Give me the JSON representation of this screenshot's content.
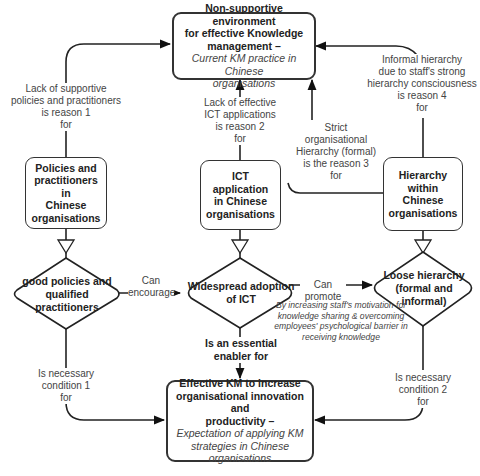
{
  "nodes": {
    "top": {
      "title_lines": [
        "Non-supportive environment",
        "for effective Knowledge",
        "management –"
      ],
      "subtitle_lines": [
        "Current KM practice in Chinese",
        "organisations"
      ]
    },
    "policies": {
      "lines": [
        "Policies and",
        "practitioners in",
        "Chinese",
        "organisations"
      ]
    },
    "ict": {
      "lines": [
        "ICT application",
        "in Chinese",
        "organisations"
      ]
    },
    "hierarchy": {
      "lines": [
        "Hierarchy within",
        "Chinese",
        "organisations"
      ]
    },
    "bottom": {
      "title_lines": [
        "Effective KM to increase",
        "organisational innovation and",
        "productivity –"
      ],
      "subtitle_lines": [
        "Expectation of applying KM",
        "strategies in Chinese",
        "organisations"
      ]
    }
  },
  "decisions": {
    "good_policies": {
      "lines": [
        "good policies and",
        "qualified",
        "practitioners"
      ]
    },
    "widespread_ict": {
      "lines": [
        "Widespread adoption",
        "of ICT"
      ]
    },
    "loose_hierarchy": {
      "lines": [
        "Loose hierarchy",
        "(formal and",
        "informal)"
      ]
    }
  },
  "edges": {
    "reason1": {
      "lines": [
        "Lack of supportive",
        "policies and practitioners",
        "is reason 1",
        "for"
      ]
    },
    "reason2": {
      "lines": [
        "Lack of effective",
        "ICT applications",
        "is reason 2",
        "for"
      ]
    },
    "reason3": {
      "lines": [
        "Strict",
        "organisational",
        "Hierarchy (formal)",
        "is the reason 3",
        "for"
      ]
    },
    "reason4": {
      "lines": [
        "Informal hierarchy",
        "due to staff's strong",
        "hierarchy consciousness",
        "is reason 4",
        "for"
      ]
    },
    "can_encourage": {
      "lines": [
        "Can",
        "encourage"
      ]
    },
    "can_promote": {
      "lines": [
        "Can promote"
      ]
    },
    "promote_note": {
      "lines": [
        "By increasing staff's motivation for",
        "knowledge sharing & overcoming",
        "employees' psychological barrier in",
        "receiving knowledge"
      ]
    },
    "enabler": {
      "lines": [
        "Is an essential",
        "enabler for"
      ]
    },
    "condition1": {
      "lines": [
        "Is necessary",
        "condition 1",
        "for"
      ]
    },
    "condition2": {
      "lines": [
        "Is necessary",
        "condition 2",
        "for"
      ]
    }
  },
  "colors": {
    "stroke": "#333333",
    "text": "#222222",
    "label": "#444444",
    "background": "#ffffff"
  }
}
